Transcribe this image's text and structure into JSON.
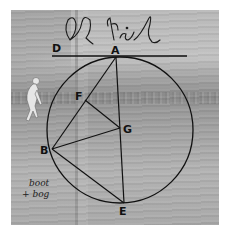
{
  "image": {
    "description": "Grayscale beach photograph with a geometric circle construction overlay and handwritten signature",
    "signature": "Al Neil",
    "handwritten_note": [
      "boot",
      "+ bog"
    ]
  },
  "diagram": {
    "points": [
      {
        "label": "D",
        "x": 57,
        "y": 50
      },
      {
        "label": "A",
        "x": 116,
        "y": 57
      },
      {
        "label": "F",
        "x": 85,
        "y": 100
      },
      {
        "label": "G",
        "x": 120,
        "y": 128
      },
      {
        "label": "B",
        "x": 52,
        "y": 149
      },
      {
        "label": "E",
        "x": 124,
        "y": 203
      }
    ],
    "circle": {
      "cx": 120,
      "cy": 130,
      "r": 73
    },
    "tangent_line": {
      "from": "D",
      "to_x": 187,
      "y": 56
    },
    "segments": [
      [
        "A",
        "E"
      ],
      [
        "A",
        "B"
      ],
      [
        "B",
        "G"
      ],
      [
        "F",
        "G"
      ],
      [
        "B",
        "E"
      ]
    ]
  },
  "colors": {
    "line": "#111111",
    "background": "#ffffff"
  }
}
